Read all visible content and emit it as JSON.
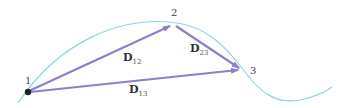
{
  "diagram": {
    "type": "displacement-vectors",
    "colors": {
      "path_curve": "#8fd4e0",
      "vector": "#8c7fcf",
      "point": "#222222",
      "text": "#333333"
    },
    "points": [
      {
        "id": "1",
        "label": "1",
        "x": 28,
        "y": 92
      },
      {
        "id": "2",
        "label": "2",
        "x": 174,
        "y": 24
      },
      {
        "id": "3",
        "label": "3",
        "x": 243,
        "y": 70
      }
    ],
    "vectors": [
      {
        "id": "D12",
        "from": "1",
        "to": "2",
        "symbol": "D",
        "subscript": "12"
      },
      {
        "id": "D23",
        "from": "2",
        "to": "3",
        "symbol": "D",
        "subscript": "23"
      },
      {
        "id": "D13",
        "from": "1",
        "to": "3",
        "symbol": "D",
        "subscript": "13"
      }
    ]
  }
}
